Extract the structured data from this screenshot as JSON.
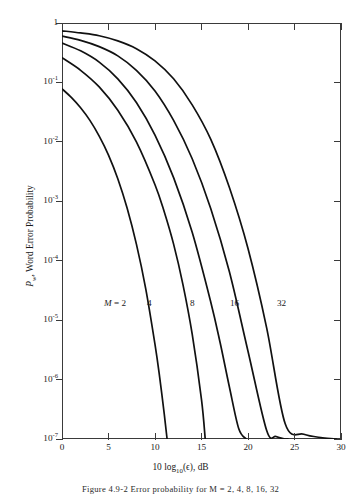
{
  "figure": {
    "caption": "Figure 4.9-2    Error probability for M = 2, 4, 8, 16, 32",
    "x_axis_title_pre": "10 log",
    "x_axis_title_sub": "10",
    "x_axis_title_post": "(ϵ), dB",
    "y_axis_title_sym": "P",
    "y_axis_title_sub": "w",
    "y_axis_title_rest": ", Word Error Probability"
  },
  "axes": {
    "x_ticks": [
      "0",
      "5",
      "10",
      "15",
      "20",
      "25",
      "30"
    ],
    "y_ticks": [
      "1",
      "10−1",
      "10−2",
      "10−3",
      "10−4",
      "10−5",
      "10−6",
      "10−7"
    ],
    "y_tick_mantissa": [
      "1",
      "10",
      "10",
      "10",
      "10",
      "10",
      "10",
      "10"
    ],
    "y_tick_exponent": [
      "",
      "-1",
      "-2",
      "-3",
      "-4",
      "-5",
      "-6",
      "-7"
    ]
  },
  "annotations": [
    {
      "prefix": "M",
      "equals": " = ",
      "value": "2",
      "x": 104,
      "y": 299
    },
    {
      "prefix": "",
      "equals": "",
      "value": "4",
      "x": 147,
      "y": 299
    },
    {
      "prefix": "",
      "equals": "",
      "value": "8",
      "x": 190,
      "y": 299
    },
    {
      "prefix": "",
      "equals": "",
      "value": "16",
      "x": 230,
      "y": 299
    },
    {
      "prefix": "",
      "equals": "",
      "value": "32",
      "x": 277,
      "y": 299
    }
  ],
  "chart_data": {
    "type": "line",
    "title": "",
    "xlabel": "10 log10(ϵ), dB",
    "ylabel": "P_w, Word Error Probability",
    "xlim": [
      0,
      30
    ],
    "ylim": [
      1e-07,
      1
    ],
    "yscale": "log",
    "xscale": "linear",
    "grid": false,
    "legend": "inline-curve-labels",
    "line_color": "#111111",
    "series": [
      {
        "name": "M = 2",
        "x": [
          0,
          1,
          2,
          3,
          4,
          5,
          6,
          7,
          8,
          9,
          10,
          10.5,
          11,
          11.3
        ],
        "y": [
          0.078,
          0.056,
          0.0375,
          0.023,
          0.0125,
          0.006,
          0.0024,
          0.00077,
          0.00019,
          3.4e-05,
          3.9e-06,
          1.1e-06,
          2.6e-07,
          1e-07
        ]
      },
      {
        "name": "M = 4",
        "x": [
          0,
          2,
          4,
          6,
          8,
          10,
          11,
          12,
          13,
          14,
          15,
          15.4
        ],
        "y": [
          0.26,
          0.16,
          0.084,
          0.034,
          0.01,
          0.0019,
          0.00066,
          0.00019,
          4e-05,
          5.8e-06,
          4.6e-07,
          1e-07
        ]
      },
      {
        "name": "M = 8",
        "x": [
          0,
          2,
          4,
          6,
          8,
          10,
          12,
          14,
          16,
          17,
          18,
          19,
          19.8
        ],
        "y": [
          0.46,
          0.34,
          0.22,
          0.115,
          0.046,
          0.013,
          0.0025,
          0.0003,
          2e-05,
          4.2e-06,
          7.5e-07,
          1.5e-07,
          1e-07
        ]
      },
      {
        "name": "M = 16",
        "x": [
          0,
          2,
          4,
          6,
          8,
          10,
          12,
          14,
          16,
          18,
          20,
          22,
          23,
          24,
          24.3
        ],
        "y": [
          0.6,
          0.51,
          0.4,
          0.28,
          0.16,
          0.072,
          0.023,
          0.0052,
          0.00075,
          6.5e-05,
          3e-06,
          1.4e-07,
          1.1e-07,
          1e-07,
          1e-07
        ]
      },
      {
        "name": "M = 32",
        "x": [
          0,
          2,
          4,
          6,
          8,
          10,
          12,
          14,
          16,
          18,
          20,
          22,
          24,
          26,
          28,
          29.5
        ],
        "y": [
          0.74,
          0.68,
          0.61,
          0.5,
          0.37,
          0.23,
          0.115,
          0.042,
          0.011,
          0.0017,
          0.00016,
          7.5e-06,
          1.8e-07,
          1.2e-07,
          1.05e-07,
          1e-07
        ]
      }
    ]
  }
}
